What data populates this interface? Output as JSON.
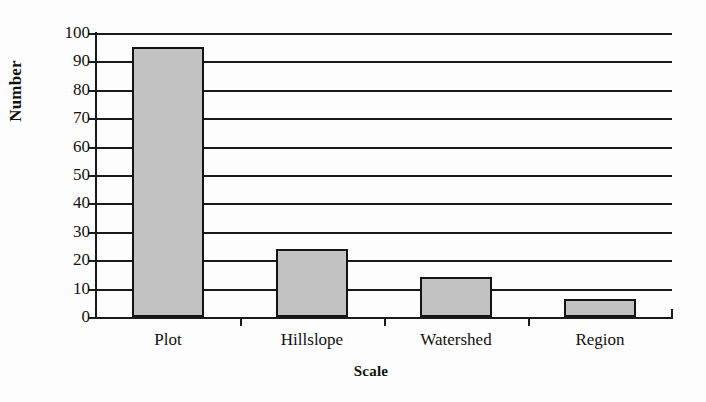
{
  "chart_data": {
    "type": "bar",
    "title": "",
    "subtitle": "",
    "xlabel": "Scale",
    "ylabel": "Number",
    "categories": [
      "Plot",
      "Hillslope",
      "Watershed",
      "Region"
    ],
    "values": [
      95,
      24,
      14,
      6.5
    ],
    "series": [
      {
        "name": "Number",
        "values": [
          95,
          24,
          14,
          6.5
        ]
      }
    ],
    "ylim": [
      0,
      100
    ],
    "yticks": [
      0,
      10,
      20,
      30,
      40,
      50,
      60,
      70,
      80,
      90,
      100
    ],
    "ytick_labels": [
      "0",
      "10",
      "20",
      "30",
      "40",
      "50",
      "60",
      "70",
      "80",
      "90",
      "100"
    ],
    "grid": true,
    "grid_axis": "y",
    "legend": false,
    "legend_position": "none",
    "bar_fill_color": "#c2c2c2",
    "bar_edge_color": "#141414",
    "axis_color": "#1a1a1a",
    "background_color": "#fdfdfd",
    "annotations": []
  }
}
